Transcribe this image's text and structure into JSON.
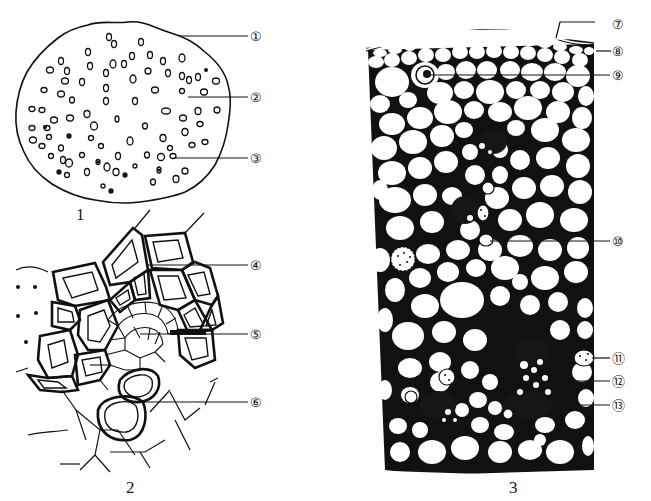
{
  "diagram": {
    "figures": [
      {
        "id": "1",
        "caption": "1",
        "labels": [
          {
            "num": "①",
            "y": 37
          },
          {
            "num": "②",
            "y": 97
          },
          {
            "num": "③",
            "y": 157
          }
        ]
      },
      {
        "id": "2",
        "caption": "2",
        "labels": [
          {
            "num": "④",
            "y": 265
          },
          {
            "num": "⑤",
            "y": 334
          },
          {
            "num": "⑥",
            "y": 402
          }
        ]
      },
      {
        "id": "3",
        "caption": "3",
        "labels": [
          {
            "num": "⑦",
            "y": 24
          },
          {
            "num": "⑧",
            "y": 51
          },
          {
            "num": "⑨",
            "y": 75
          },
          {
            "num": "⑩",
            "y": 241
          },
          {
            "num": "⑪",
            "y": 355
          },
          {
            "num": "⑫",
            "y": 381
          },
          {
            "num": "⑬",
            "y": 405
          }
        ]
      }
    ]
  },
  "colors": {
    "line": "#111111",
    "fill_dark": "#161616",
    "background": "#ffffff"
  }
}
